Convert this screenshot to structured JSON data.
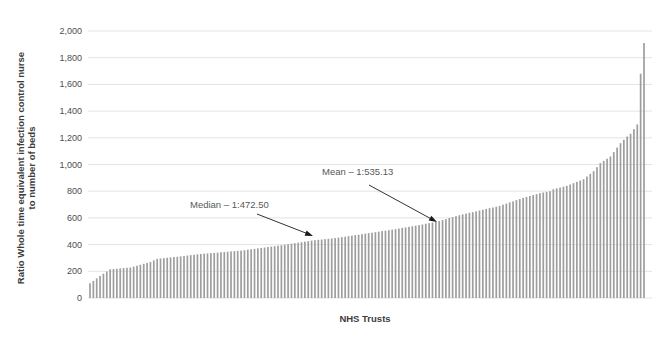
{
  "chart_data": {
    "type": "bar",
    "title": "",
    "xlabel": "NHS Trusts",
    "ylabel": "Ratio Whole time equivalent infection control nurse to number of beds",
    "ylabel_lines": [
      "Ratio Whole time equivalent infection control nurse",
      "to number of beds"
    ],
    "ylim": [
      0,
      2000
    ],
    "grid": true,
    "legend": "none",
    "ytick_values": [
      0,
      200,
      400,
      600,
      800,
      1000,
      1200,
      1400,
      1600,
      1800,
      2000
    ],
    "ytick_labels": [
      "0",
      "200",
      "400",
      "600",
      "800",
      "1,000",
      "1,200",
      "1,400",
      "1,600",
      "1,800",
      "2,000"
    ],
    "bar_color": "#9e9e9e",
    "gridline_color": "#e4e4e4",
    "annotation_color": "#595959",
    "values": [
      110,
      128,
      147,
      165,
      182,
      198,
      215,
      217,
      219,
      222,
      224,
      226,
      228,
      235,
      242,
      249,
      256,
      263,
      270,
      282,
      293,
      296,
      298,
      301,
      304,
      307,
      309,
      312,
      315,
      318,
      321,
      324,
      327,
      330,
      332,
      334,
      336,
      338,
      340,
      343,
      345,
      347,
      349,
      351,
      353,
      355,
      358,
      362,
      365,
      368,
      372,
      375,
      378,
      382,
      385,
      388,
      392,
      395,
      399,
      403,
      407,
      411,
      414,
      418,
      422,
      426,
      430,
      433,
      436,
      438,
      441,
      444,
      446,
      449,
      452,
      456,
      459,
      463,
      467,
      471,
      474,
      478,
      482,
      486,
      489,
      493,
      497,
      501,
      504,
      508,
      512,
      516,
      520,
      525,
      529,
      533,
      537,
      542,
      546,
      551,
      556,
      561,
      565,
      570,
      577,
      584,
      591,
      599,
      606,
      613,
      620,
      626,
      632,
      638,
      643,
      649,
      655,
      661,
      667,
      673,
      678,
      684,
      690,
      699,
      707,
      716,
      724,
      733,
      741,
      750,
      757,
      764,
      771,
      778,
      785,
      790,
      795,
      800,
      815,
      821,
      827,
      834,
      840,
      850,
      860,
      870,
      880,
      890,
      910,
      930,
      950,
      980,
      1010,
      1027,
      1043,
      1060,
      1093,
      1127,
      1160,
      1185,
      1210,
      1230,
      1265,
      1300,
      1680,
      1910
    ],
    "annotations": {
      "median": {
        "text": "Median – 1:472.50",
        "value": 472.5
      },
      "mean": {
        "text": "Mean – 1:535.13",
        "value": 535.13
      }
    }
  }
}
